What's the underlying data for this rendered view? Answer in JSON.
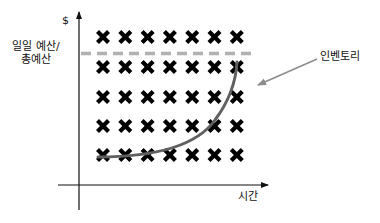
{
  "diagram": {
    "y_axis_symbol": "$",
    "y_label_line1": "일일 예산/",
    "y_label_line2": "총예산",
    "x_label": "시간",
    "inventory_label": "인벤토리",
    "grid": {
      "rows": 5,
      "cols": 7
    },
    "colors": {
      "cross": "#000000",
      "dashed_line": "#b0b0b0",
      "curve": "#606060",
      "arrow": "#8c8c8c",
      "axis": "#111111"
    }
  }
}
